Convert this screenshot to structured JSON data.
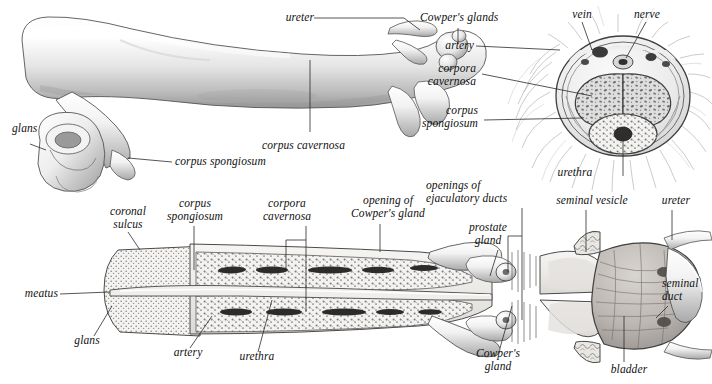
{
  "figure": {
    "style": "grayscale pen-and-ink medical illustration",
    "background_color": "#ffffff",
    "ink_color": "#111111",
    "leader_line_color": "#2b2b2b"
  },
  "panels": {
    "lateral": {
      "name": "lateral external view"
    },
    "cross_section": {
      "name": "transverse cross-section of shaft"
    },
    "sagittal": {
      "name": "midsagittal cut-away of penis, prostate and bladder"
    }
  },
  "labels": {
    "ureter_top": "ureter",
    "cowpers_glands": "Cowper's glands",
    "glans_top": "glans",
    "corpus_spongiosum_top": "corpus spongiosum",
    "corpus_cavernosa_top": "corpus cavernosa",
    "vein": "vein",
    "nerve": "nerve",
    "artery_xs": "artery",
    "corpora_cavernosa_xs": "corpora\ncavernosa",
    "corpus_spongiosum_xs": "corpus\nspongiosum",
    "urethra_xs": "urethra",
    "coronal_sulcus": "coronal\nsulcus",
    "corpus_spongiosum_sag": "corpus\nspongiosum",
    "corpora_cavernosa_sag": "corpora\ncavernosa",
    "opening_cowpers_gland": "opening of\nCowper's gland",
    "openings_ejaculatory_ducts": "openings of\nejaculatory ducts",
    "prostate_gland": "prostate\ngland",
    "seminal_vesicle": "seminal vesicle",
    "ureter_bottom": "ureter",
    "seminal_duct": "seminal\nduct",
    "meatus": "meatus",
    "glans_bottom": "glans",
    "artery_sag": "artery",
    "urethra_sag": "urethra",
    "cowpers_gland_bottom": "Cowper's\ngland",
    "bladder": "bladder"
  }
}
